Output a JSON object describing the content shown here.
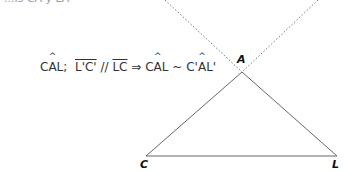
{
  "header": {
    "clipped_text": "...is CA y LA'"
  },
  "formula": {
    "part1_pre": "C",
    "part1_hat": "A",
    "part1_post": "L;",
    "seg1": "L'C'",
    "parallel": "//",
    "seg2": "LC",
    "implies": "⇒",
    "part2_pre": "C",
    "part2_hat": "A",
    "part2_post": "L",
    "similar": "~",
    "part3_pre": "C'",
    "part3_hat": "A",
    "part3_post": "L'"
  },
  "figure": {
    "vertices": {
      "A": "A",
      "C": "C",
      "L": "L"
    },
    "colors": {
      "triangle": "#666666",
      "dotted": "#777777"
    }
  }
}
